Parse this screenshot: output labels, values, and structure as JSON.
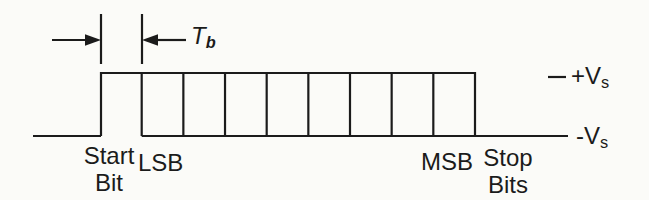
{
  "colors": {
    "ink": "#1b1b1b",
    "paper": "#fbfbf8"
  },
  "labels": {
    "bit_time": {
      "main": "T",
      "sub": "b"
    },
    "start_bit": {
      "line1": "Start",
      "line2": "Bit"
    },
    "lsb": "LSB",
    "msb": "MSB",
    "stop_bits": {
      "line1": "Stop",
      "line2": "Bits"
    },
    "high_level": {
      "main": "+V",
      "sub": "s"
    },
    "low_level": {
      "main": "-V",
      "sub": "s"
    }
  },
  "waveform": {
    "data_bit_cells": 8,
    "start_bit_level": "high",
    "stop_bits_level": "low"
  }
}
